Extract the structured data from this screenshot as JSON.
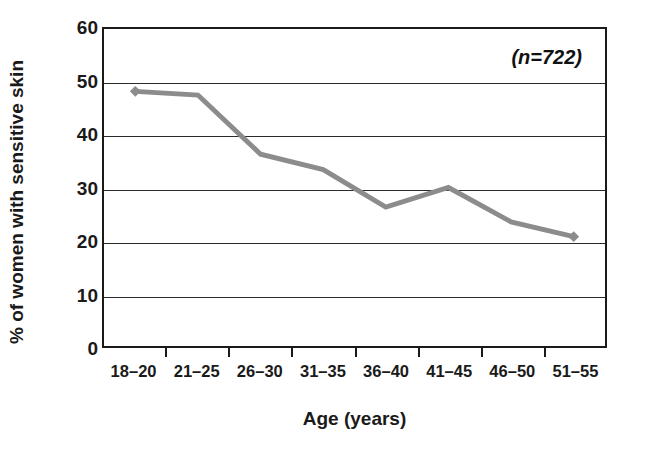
{
  "chart_data": {
    "type": "line",
    "title": "",
    "subtitle": "",
    "xlabel": "Age (years)",
    "ylabel": "% of women with sensitive skin",
    "categories": [
      "18–20",
      "21–25",
      "26–30",
      "31–35",
      "36–40",
      "41–45",
      "46–50",
      "51–55"
    ],
    "values": [
      48.2,
      47.5,
      36.3,
      33.4,
      26.3,
      30.0,
      23.5,
      20.7
    ],
    "series": [
      {
        "name": "% of women with sensitive skin",
        "values": [
          48.2,
          47.5,
          36.3,
          33.4,
          26.3,
          30.0,
          23.5,
          20.7
        ]
      }
    ],
    "ylim": [
      0,
      60
    ],
    "yticks": [
      0,
      10,
      20,
      30,
      40,
      50,
      60
    ],
    "ytick_labels": [
      "0",
      "10",
      "20",
      "30",
      "40",
      "50",
      "60"
    ],
    "grid": true,
    "grid_axis": "y",
    "legend": false,
    "legend_position": "none",
    "annotations": [
      {
        "text": "(n=722)",
        "position": "top-right-inside"
      }
    ],
    "marker": "diamond",
    "line_color": "#8c8c8c",
    "marker_color": "#8c8c8c",
    "axis_color": "#1a1a1a",
    "grid_color": "#2b2b2b",
    "background_color": "#ffffff"
  }
}
